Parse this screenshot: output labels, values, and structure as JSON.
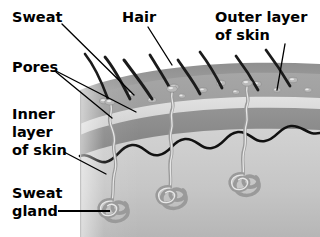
{
  "figure": {
    "background_color": "#ffffff"
  },
  "labels": [
    {
      "id": "sweat",
      "lines": [
        "Sweat"
      ],
      "x": 12,
      "y": 22
    },
    {
      "id": "hair",
      "lines": [
        "Hair"
      ],
      "x": 122,
      "y": 22
    },
    {
      "id": "outer_layer",
      "lines": [
        "Outer layer",
        "of skin"
      ],
      "x": 215,
      "y": 22
    },
    {
      "id": "pores",
      "lines": [
        "Pores"
      ],
      "x": 12,
      "y": 72
    },
    {
      "id": "inner_layer",
      "lines": [
        "Inner",
        "layer",
        "of skin"
      ],
      "x": 12,
      "y": 119
    },
    {
      "id": "sweat_gland",
      "lines": [
        "Sweat",
        "gland"
      ],
      "x": 12,
      "y": 198
    }
  ],
  "colors": {
    "outer_layer_top": "#9c9c9c",
    "outer_layer_body": "#a3a3a3",
    "pale_band": "#d6d6d6",
    "mid_band": "#8a8a8a",
    "inner_layer": "#c9c9c9",
    "inner_layer_deep": "#bdbdbd",
    "hair_color": "#1b1b1b",
    "duct_color": "#9a9a9a",
    "boundary_color": "#111111",
    "label_color": "#000000",
    "leader_color": "#000000"
  },
  "structures": {
    "hair_count": 8,
    "sweat_gland_count": 3,
    "droplet_count": 12,
    "pore_count": 3,
    "layer_names": [
      "Outer layer of skin",
      "Inner layer of skin"
    ]
  }
}
